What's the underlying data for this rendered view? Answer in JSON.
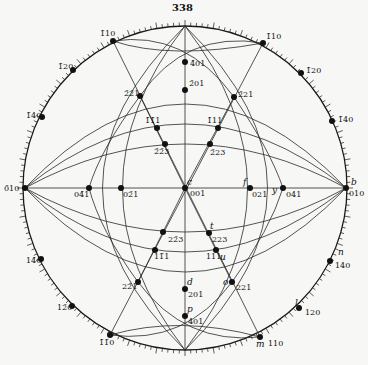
{
  "figure": {
    "number": "338",
    "type": "stereographic projection of crystal faces",
    "colors": {
      "ink": "#1a1a1a",
      "paper": "#f7f7f5"
    }
  },
  "center": {
    "x": 185,
    "y": 188
  },
  "radius": 162,
  "poles": [
    {
      "id": "001",
      "label": "001",
      "letter": "c",
      "x": 185,
      "y": 188,
      "lx": 190,
      "ly": 190,
      "letx": 187,
      "lety": 178
    },
    {
      "id": "010",
      "label": "010",
      "letter": "b",
      "x": 346,
      "y": 188,
      "lx": 349,
      "ly": 190,
      "letx": 351,
      "lety": 178
    },
    {
      "id": "0-10",
      "label": "0̄10",
      "letter": "",
      "x": 25,
      "y": 188,
      "lx": 4,
      "ly": 185,
      "letx": 0,
      "lety": 0
    },
    {
      "id": "021",
      "label": "021",
      "letter": "f",
      "x": 250,
      "y": 188,
      "lx": 252,
      "ly": 191,
      "letx": 243,
      "lety": 178
    },
    {
      "id": "041",
      "label": "041",
      "letter": "y",
      "x": 283,
      "y": 188,
      "lx": 286,
      "ly": 191,
      "letx": 272,
      "lety": 186
    },
    {
      "id": "0-21",
      "label": "02̄1",
      "letter": "",
      "x": 121,
      "y": 188,
      "lx": 123,
      "ly": 191,
      "letx": 0,
      "lety": 0
    },
    {
      "id": "0-41",
      "label": "04̄1",
      "letter": "",
      "x": 89,
      "y": 188,
      "lx": 74,
      "ly": 191,
      "letx": 0,
      "lety": 0
    },
    {
      "id": "-201",
      "label": "2̄01",
      "letter": "",
      "x": 185,
      "y": 90,
      "lx": 189,
      "ly": 80,
      "letx": 0,
      "lety": 0
    },
    {
      "id": "-401",
      "label": "4̄01",
      "letter": "",
      "x": 185,
      "y": 62,
      "lx": 190,
      "ly": 60,
      "letx": 0,
      "lety": 0
    },
    {
      "id": "201",
      "label": "201",
      "letter": "d",
      "x": 185,
      "y": 289,
      "lx": 188,
      "ly": 291,
      "letx": 187,
      "lety": 278
    },
    {
      "id": "401",
      "label": "401",
      "letter": "p",
      "x": 185,
      "y": 316,
      "lx": 188,
      "ly": 318,
      "letx": 187,
      "lety": 305
    },
    {
      "id": "-110",
      "label": "1̄10",
      "letter": "",
      "x": 113,
      "y": 41,
      "lx": 100,
      "ly": 30,
      "letx": 0,
      "lety": 0
    },
    {
      "id": "-1-10",
      "label": "1̄1̄0",
      "letter": "",
      "x": 110,
      "y": 335,
      "lx": 99,
      "ly": 339,
      "letx": 0,
      "lety": 0
    },
    {
      "id": "-1-10r",
      "label": "1̄10",
      "letter": "",
      "x": 263,
      "y": 43,
      "lx": 266,
      "ly": 33,
      "letx": 0,
      "lety": 0
    },
    {
      "id": "110",
      "label": "110",
      "letter": "m",
      "x": 260,
      "y": 337,
      "lx": 268,
      "ly": 340,
      "letx": 256,
      "lety": 340
    },
    {
      "id": "-120",
      "label": "1̄20",
      "letter": "",
      "x": 73,
      "y": 70,
      "lx": 58,
      "ly": 63,
      "letx": 0,
      "lety": 0
    },
    {
      "id": "-140",
      "label": "1̄40",
      "letter": "",
      "x": 42,
      "y": 117,
      "lx": 26,
      "ly": 112,
      "letx": 0,
      "lety": 0
    },
    {
      "id": "-120r",
      "label": "1̄20",
      "letter": "",
      "x": 301,
      "y": 73,
      "lx": 306,
      "ly": 67,
      "letx": 0,
      "lety": 0
    },
    {
      "id": "-140r",
      "label": "1̄40",
      "letter": "",
      "x": 332,
      "y": 121,
      "lx": 338,
      "ly": 116,
      "letx": 0,
      "lety": 0
    },
    {
      "id": "1-40",
      "label": "14̄0",
      "letter": "",
      "x": 41,
      "y": 259,
      "lx": 26,
      "ly": 257,
      "letx": 0,
      "lety": 0
    },
    {
      "id": "1-20",
      "label": "12̄0",
      "letter": "",
      "x": 72,
      "y": 306,
      "lx": 57,
      "ly": 304,
      "letx": 0,
      "lety": 0
    },
    {
      "id": "140",
      "label": "140",
      "letter": "n",
      "x": 330,
      "y": 261,
      "lx": 335,
      "ly": 262,
      "letx": 338,
      "lety": 248
    },
    {
      "id": "120",
      "label": "120",
      "letter": "l",
      "x": 299,
      "y": 308,
      "lx": 305,
      "ly": 309,
      "letx": 295,
      "lety": 299
    },
    {
      "id": "-2-21",
      "label": "2̄2̄1",
      "letter": "",
      "x": 140,
      "y": 96,
      "lx": 124,
      "ly": 90,
      "letx": 0,
      "lety": 0
    },
    {
      "id": "-221",
      "label": "2̄21",
      "letter": "",
      "x": 234,
      "y": 97,
      "lx": 238,
      "ly": 91,
      "letx": 0,
      "lety": 0
    },
    {
      "id": "-1-11",
      "label": "1̄1̄1",
      "letter": "",
      "x": 157,
      "y": 128,
      "lx": 145,
      "ly": 117,
      "letx": 0,
      "lety": 0
    },
    {
      "id": "-111",
      "label": "1̄11",
      "letter": "",
      "x": 218,
      "y": 128,
      "lx": 207,
      "ly": 117,
      "letx": 0,
      "lety": 0
    },
    {
      "id": "-2-23",
      "label": "2̄2̄3",
      "letter": "",
      "x": 165,
      "y": 144,
      "lx": 154,
      "ly": 148,
      "letx": 0,
      "lety": 0
    },
    {
      "id": "-223",
      "label": "2̄23",
      "letter": "",
      "x": 210,
      "y": 144,
      "lx": 210,
      "ly": 149,
      "letx": 0,
      "lety": 0
    },
    {
      "id": "2-23",
      "label": "22̄3",
      "letter": "",
      "x": 163,
      "y": 232,
      "lx": 168,
      "ly": 236,
      "letx": 0,
      "lety": 0
    },
    {
      "id": "223",
      "label": "223",
      "letter": "t",
      "x": 209,
      "y": 233,
      "lx": 212,
      "ly": 236,
      "letx": 210,
      "lety": 222
    },
    {
      "id": "1-11",
      "label": "11̄1",
      "letter": "",
      "x": 155,
      "y": 250,
      "lx": 154,
      "ly": 253,
      "letx": 0,
      "lety": 0
    },
    {
      "id": "111",
      "label": "111",
      "letter": "u",
      "x": 216,
      "y": 250,
      "lx": 206,
      "ly": 253,
      "letx": 220,
      "lety": 253
    },
    {
      "id": "2-21",
      "label": "22̄1",
      "letter": "",
      "x": 138,
      "y": 282,
      "lx": 122,
      "ly": 283,
      "letx": 0,
      "lety": 0
    },
    {
      "id": "221",
      "label": "221",
      "letter": "o",
      "x": 232,
      "y": 282,
      "lx": 236,
      "ly": 284,
      "letx": 223,
      "lety": 278
    }
  ],
  "zones": [
    {
      "type": "line",
      "from": "0-10",
      "to": "010"
    },
    {
      "type": "line",
      "from": "top",
      "to": "bottom"
    },
    {
      "type": "line",
      "from": "-110",
      "to": "110"
    },
    {
      "type": "line",
      "from": "-1-10r",
      "to": "-1-10"
    }
  ]
}
